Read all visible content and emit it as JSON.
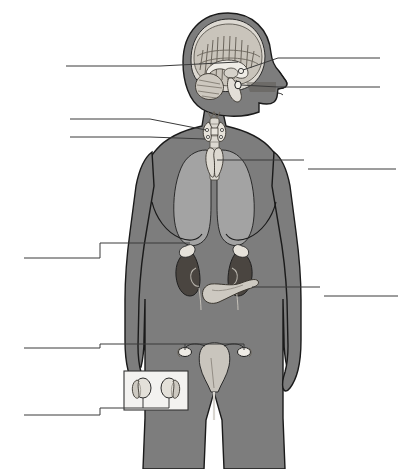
{
  "figure": {
    "width": 415,
    "height": 469,
    "background_color": "#ffffff"
  },
  "palette": {
    "background": "#ffffff",
    "body_fill": "#7d7d7d",
    "body_outline": "#1a1a1a",
    "lung_fill": "#a3a3a3",
    "organ_light": "#d8d5cf",
    "organ_mid": "#bdb9b1",
    "organ_dark": "#5c5750",
    "kidney_fill": "#4a4540",
    "leader_line": "#3a3a3a",
    "inset_box_fill": "#f3f2f0",
    "inset_box_border": "#333333"
  },
  "figure_parts": [
    {
      "id": "head",
      "name": "head-sagittal-section",
      "description": "Profile head facing right with mid-sagittal brain section"
    },
    {
      "id": "brain",
      "name": "brain-section",
      "description": "Cerebrum with gyri, corpus callosum, cerebellum, brainstem"
    },
    {
      "id": "pineal",
      "name": "pineal-gland",
      "description": "Small gland at top of brainstem"
    },
    {
      "id": "pituitary",
      "name": "pituitary-gland",
      "description": "Gland below hypothalamus on sella turcica"
    },
    {
      "id": "thyroid",
      "name": "thyroid-gland",
      "description": "Butterfly-shaped gland on the trachea in the neck"
    },
    {
      "id": "parathyroid",
      "name": "parathyroid-glands",
      "description": "Four small glands on posterior thyroid"
    },
    {
      "id": "thymus",
      "name": "thymus",
      "description": "Lobed gland behind the sternum between the lungs"
    },
    {
      "id": "lungs",
      "name": "lungs",
      "description": "Two light gray lung fields in the thorax"
    },
    {
      "id": "kidneys",
      "name": "kidneys",
      "description": "Pair of bean-shaped organs in the abdomen"
    },
    {
      "id": "adrenals",
      "name": "adrenal-glands",
      "description": "Light caps sitting on top of each kidney"
    },
    {
      "id": "pancreas",
      "name": "pancreas",
      "description": "Elongated gland below and between the kidneys"
    },
    {
      "id": "uterus",
      "name": "uterus",
      "description": "Pear-shaped organ in the pelvis"
    },
    {
      "id": "ovaries",
      "name": "ovaries",
      "description": "Pair of small oval glands flanking the uterus"
    },
    {
      "id": "testes",
      "name": "testes-inset",
      "description": "Inset box showing a pair of testes with epididymis"
    }
  ],
  "leader_lines": [
    {
      "id": "line-1",
      "name": "leader-line-left-1",
      "side": "left",
      "label": "",
      "target": "hypothalamus-region",
      "line_y": 66,
      "label_x": 66,
      "label_y": 62
    },
    {
      "id": "line-2",
      "name": "leader-line-right-1",
      "side": "right",
      "label": "",
      "target": "pineal-gland",
      "line_y": 62,
      "label_x": 282,
      "label_y": 58
    },
    {
      "id": "line-3",
      "name": "leader-line-right-2",
      "side": "right",
      "label": "",
      "target": "pituitary-gland",
      "line_y": 88,
      "label_x": 282,
      "label_y": 84
    },
    {
      "id": "line-4",
      "name": "leader-line-left-2",
      "side": "left",
      "label": "",
      "target": "thyroid-gland",
      "line_y": 119,
      "label_x": 70,
      "label_y": 115
    },
    {
      "id": "line-5",
      "name": "leader-line-left-3",
      "side": "left",
      "label": "",
      "target": "parathyroid-glands",
      "line_y": 137,
      "label_x": 70,
      "label_y": 133
    },
    {
      "id": "line-6",
      "name": "leader-line-right-3",
      "side": "right",
      "label": "",
      "target": "thymus",
      "line_y": 160,
      "label_x": 308,
      "label_y": 156
    },
    {
      "id": "line-7",
      "name": "leader-line-left-4",
      "side": "left",
      "label": "",
      "target": "adrenal-glands",
      "line_y": 250,
      "label_x": 24,
      "label_y": 246
    },
    {
      "id": "line-8",
      "name": "leader-line-right-4",
      "side": "right",
      "label": "",
      "target": "pancreas",
      "line_y": 287,
      "label_x": 322,
      "label_y": 283
    },
    {
      "id": "line-9",
      "name": "leader-line-left-5",
      "side": "left",
      "label": "",
      "target": "ovaries",
      "line_y": 340,
      "label_x": 24,
      "label_y": 336
    },
    {
      "id": "line-10",
      "name": "leader-line-left-6",
      "side": "left",
      "label": "",
      "target": "testes-inset",
      "line_y": 408,
      "label_x": 24,
      "label_y": 404
    }
  ]
}
